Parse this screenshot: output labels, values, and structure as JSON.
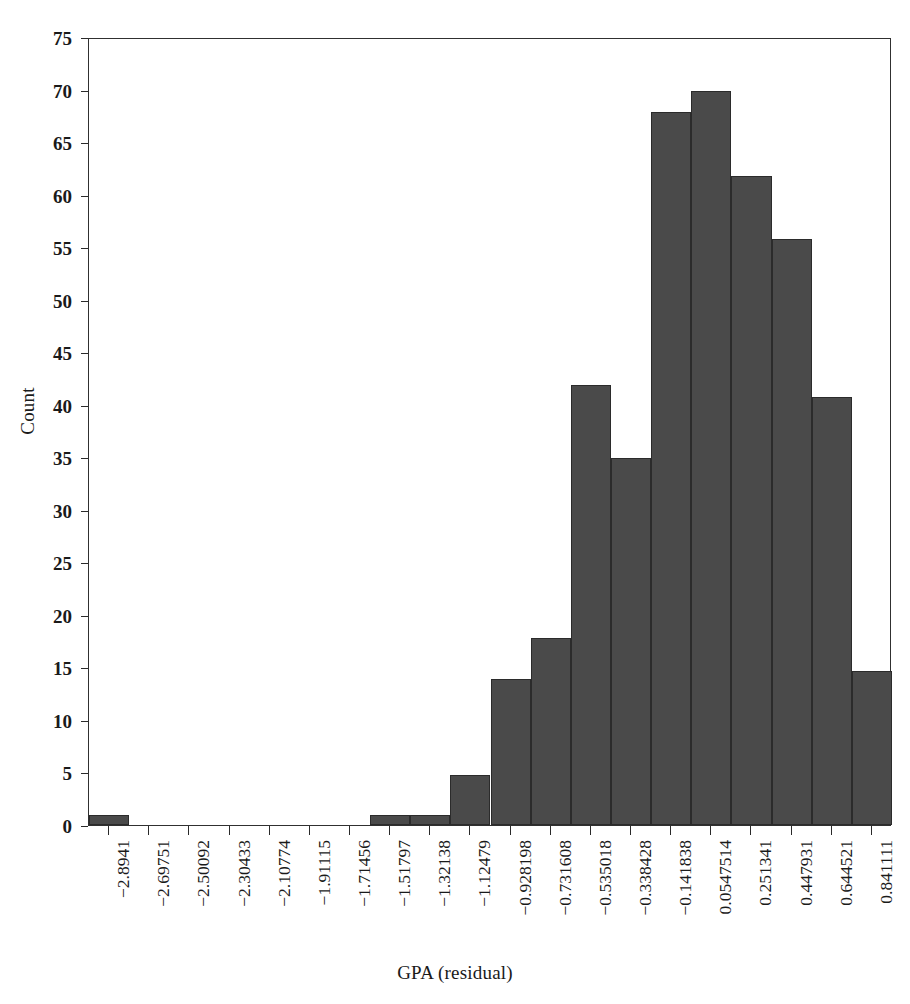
{
  "chart_data": {
    "type": "bar",
    "title": "",
    "subtitle": "",
    "xlabel": "GPA (residual)",
    "ylabel": "Count",
    "grid": false,
    "legend": null,
    "ylim": [
      0,
      75
    ],
    "ytick_values": [
      0,
      5,
      10,
      15,
      20,
      25,
      30,
      35,
      40,
      45,
      50,
      55,
      60,
      65,
      70,
      75
    ],
    "ytick_labels": [
      "0",
      "5",
      "10",
      "15",
      "20",
      "25",
      "30",
      "35",
      "40",
      "45",
      "50",
      "55",
      "60",
      "65",
      "70",
      "75"
    ],
    "categories": [
      "−2.8941",
      "−2.69751",
      "−2.50092",
      "−2.30433",
      "−2.10774",
      "−1.91115",
      "−1.71456",
      "−1.51797",
      "−1.32138",
      "−1.12479",
      "−0.928198",
      "−0.731608",
      "−0.535018",
      "−0.338428",
      "−0.141838",
      "0.0547514",
      "0.251341",
      "0.447931",
      "0.644521",
      "0.841111"
    ],
    "values": [
      1,
      0,
      0,
      0,
      0,
      0,
      0,
      1,
      1,
      4.8,
      13.9,
      17.8,
      41.9,
      34.9,
      67.9,
      69.9,
      61.8,
      55.8,
      40.7,
      14.7
    ],
    "bar_color": "#4a4a4a",
    "bar_edge_color": "#2b2b2b",
    "axis_color": "#303030",
    "background_color": "#ffffff"
  }
}
